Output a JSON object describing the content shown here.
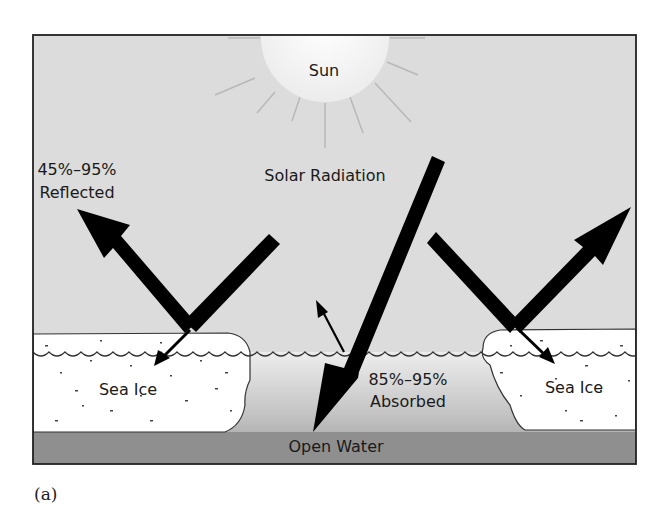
{
  "figure": {
    "caption": "(a)",
    "colors": {
      "sky": "#dcdcdc",
      "sun": "#f8f8f8",
      "ice": "#ffffff",
      "water_top": "#ececec",
      "water_bottom": "#9c9c9c",
      "seabed": "#8f8f8f",
      "arrow": "#000000",
      "frame": "#222222"
    },
    "labels": {
      "sun": "Sun",
      "solar_radiation": "Solar Radiation",
      "reflected_pct": "45%–95%",
      "reflected": "Reflected",
      "absorbed_pct": "85%–95%",
      "absorbed": "Absorbed",
      "sea_ice_left": "Sea Ice",
      "sea_ice_right": "Sea Ice",
      "open_water": "Open Water"
    }
  }
}
